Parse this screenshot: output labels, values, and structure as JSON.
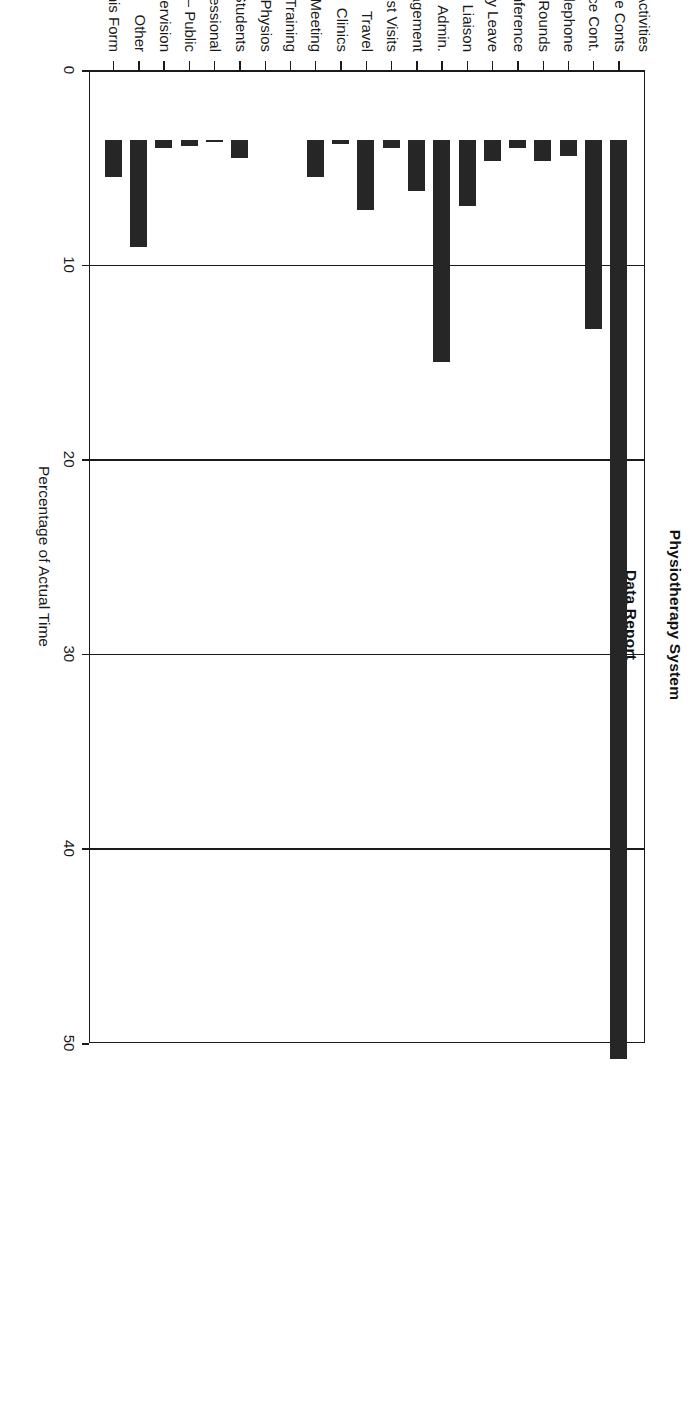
{
  "figure": {
    "title": "Physiotherapy System",
    "subtitle": "Data Report",
    "category_axis_title": "Activities",
    "value_axis_title": "Percentage of Actual Time"
  },
  "chart_data": {
    "type": "bar",
    "orientation": "vertical-rotated",
    "title": "Physiotherapy System",
    "subtitle": "Data Report",
    "xlabel": "Activities",
    "ylabel": "Percentage of Actual Time",
    "ylim": [
      0,
      50
    ],
    "yticks": [
      0,
      10,
      20,
      30,
      40,
      50
    ],
    "ytick_labels": [
      "0",
      "10",
      "20",
      "30",
      "40",
      "50"
    ],
    "grid": true,
    "legend": false,
    "bar_color": "#262626",
    "categories": [
      "Ind. Face/Face Conts",
      "Group Face/Face Cont.",
      "Telephone",
      "Ward Rounds",
      "Case Conference",
      "Study Leave",
      "Liaison",
      "Admin.",
      "Management",
      "Home Assesst Visits",
      "Travel",
      "Clinics",
      "Staff/Team Meeting",
      "In Service Training",
      "Teaching  –  Physios",
      "–  Students",
      "–  Health Professional",
      "–  Public",
      "Clinical Supervision",
      "Other",
      "Completing this Form"
    ],
    "values": [
      47.2,
      9.7,
      0.8,
      1.1,
      0.4,
      1.1,
      3.4,
      11.4,
      2.6,
      0.4,
      3.6,
      0.2,
      1.9,
      0.0,
      0.0,
      0.9,
      0.1,
      0.3,
      0.4,
      5.5,
      1.9
    ]
  }
}
